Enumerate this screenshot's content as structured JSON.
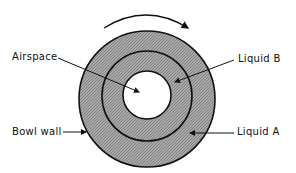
{
  "diagram": {
    "rotation_direction": "clockwise",
    "labels": {
      "airspace": "Airspace",
      "liquid_b": "Liquid B",
      "bowl_wall": "Bowl wall",
      "liquid_a": "Liquid A"
    },
    "colors": {
      "liquid_fill": "#9a9a9a",
      "airspace_fill": "#ffffff",
      "stroke": "#111111"
    }
  }
}
